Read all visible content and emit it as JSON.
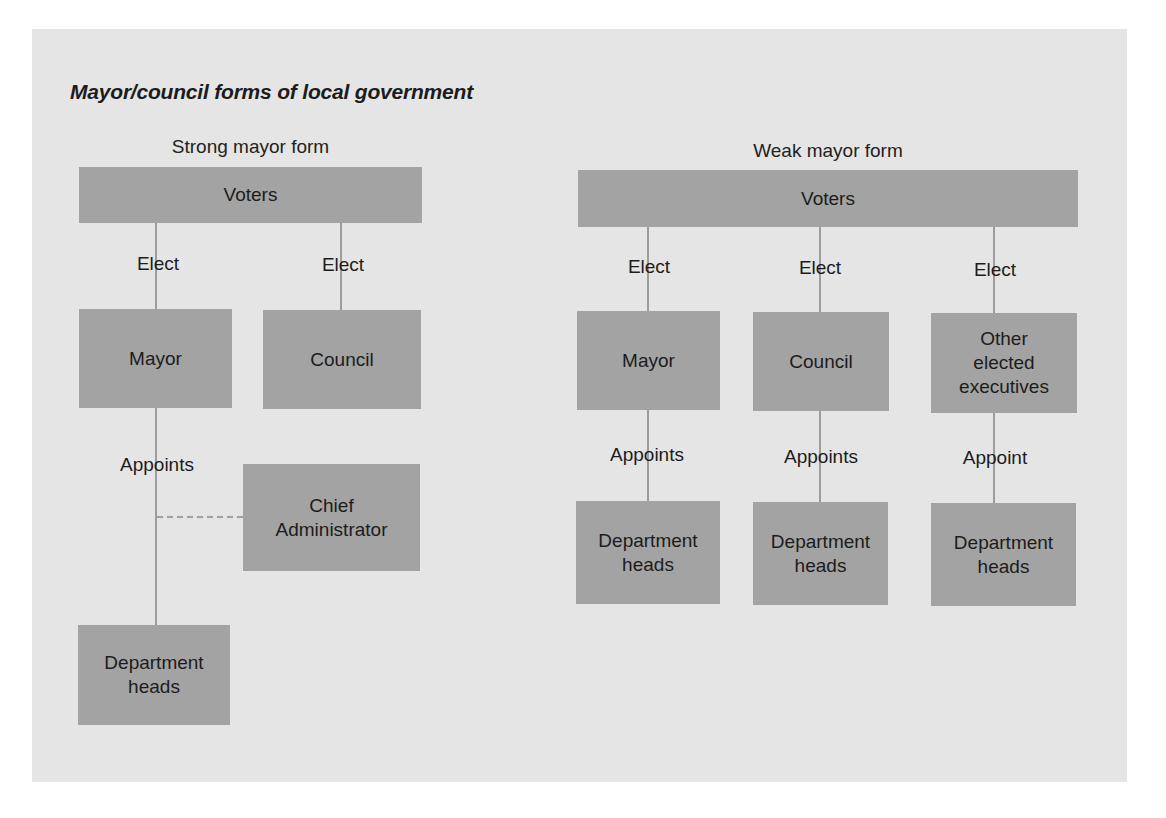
{
  "title": "Mayor/council forms of local government",
  "strong": {
    "heading": "Strong mayor form",
    "voters": "Voters",
    "elect_mayor": "Elect",
    "elect_council": "Elect",
    "mayor": "Mayor",
    "council": "Council",
    "appoints": "Appoints",
    "chief_admin": "Chief\nAdministrator",
    "dept_heads": "Department\nheads"
  },
  "weak": {
    "heading": "Weak mayor form",
    "voters": "Voters",
    "columns": [
      {
        "elect": "Elect",
        "office": "Mayor",
        "appoint": "Appoints",
        "dept_heads": "Department\nheads"
      },
      {
        "elect": "Elect",
        "office": "Council",
        "appoint": "Appoints",
        "dept_heads": "Department\nheads"
      },
      {
        "elect": "Elect",
        "office": "Other\nelected\nexecutives",
        "appoint": "Appoint",
        "dept_heads": "Department\nheads"
      }
    ]
  },
  "colors": {
    "panel_background": "#e5e5e5",
    "box_fill": "#a3a3a3",
    "connector": "#9c9c9c",
    "text": "#1c1c1c"
  }
}
